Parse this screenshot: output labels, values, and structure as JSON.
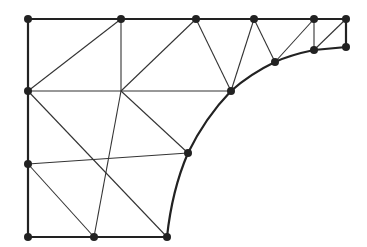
{
  "diagram": {
    "type": "triangular-mesh",
    "colors": {
      "line": "#333333",
      "boundary": "#222222",
      "node": "#222222",
      "background": "#ffffff"
    },
    "nodes": [
      {
        "id": "n1",
        "x": 28,
        "y": 19
      },
      {
        "id": "n2",
        "x": 121,
        "y": 19
      },
      {
        "id": "n3",
        "x": 196,
        "y": 19
      },
      {
        "id": "n4",
        "x": 254,
        "y": 19
      },
      {
        "id": "n5",
        "x": 314,
        "y": 19
      },
      {
        "id": "n6",
        "x": 346,
        "y": 19
      },
      {
        "id": "n7",
        "x": 346,
        "y": 47
      },
      {
        "id": "n8",
        "x": 314,
        "y": 50
      },
      {
        "id": "n9",
        "x": 275,
        "y": 62
      },
      {
        "id": "n10",
        "x": 231,
        "y": 91
      },
      {
        "id": "n11",
        "x": 188,
        "y": 153
      },
      {
        "id": "n12",
        "x": 167,
        "y": 237
      },
      {
        "id": "n13",
        "x": 94,
        "y": 237
      },
      {
        "id": "n14",
        "x": 28,
        "y": 237
      },
      {
        "id": "n15",
        "x": 28,
        "y": 164
      },
      {
        "id": "n16",
        "x": 28,
        "y": 91
      }
    ],
    "interior_points": [
      {
        "id": "a",
        "x": 121,
        "y": 91
      },
      {
        "id": "b",
        "x": 103,
        "y": 160
      }
    ],
    "boundary_path": "M28,19 L346,19 L346,47 L314,50 Q290,55 275,62 Q250,74 231,91 Q205,118 188,153 Q172,190 167,237 L28,237 Z",
    "edges": [
      [
        28,
        91,
        121,
        19
      ],
      [
        121,
        19,
        121,
        91
      ],
      [
        28,
        91,
        231,
        91
      ],
      [
        121,
        91,
        196,
        19
      ],
      [
        196,
        19,
        231,
        91
      ],
      [
        254,
        19,
        231,
        91
      ],
      [
        254,
        19,
        275,
        62
      ],
      [
        275,
        62,
        314,
        19
      ],
      [
        314,
        19,
        314,
        50
      ],
      [
        314,
        50,
        346,
        19
      ],
      [
        28,
        91,
        167,
        237
      ],
      [
        121,
        91,
        94,
        237
      ],
      [
        121,
        91,
        188,
        153
      ],
      [
        28,
        164,
        188,
        153
      ],
      [
        28,
        164,
        94,
        237
      ]
    ]
  }
}
